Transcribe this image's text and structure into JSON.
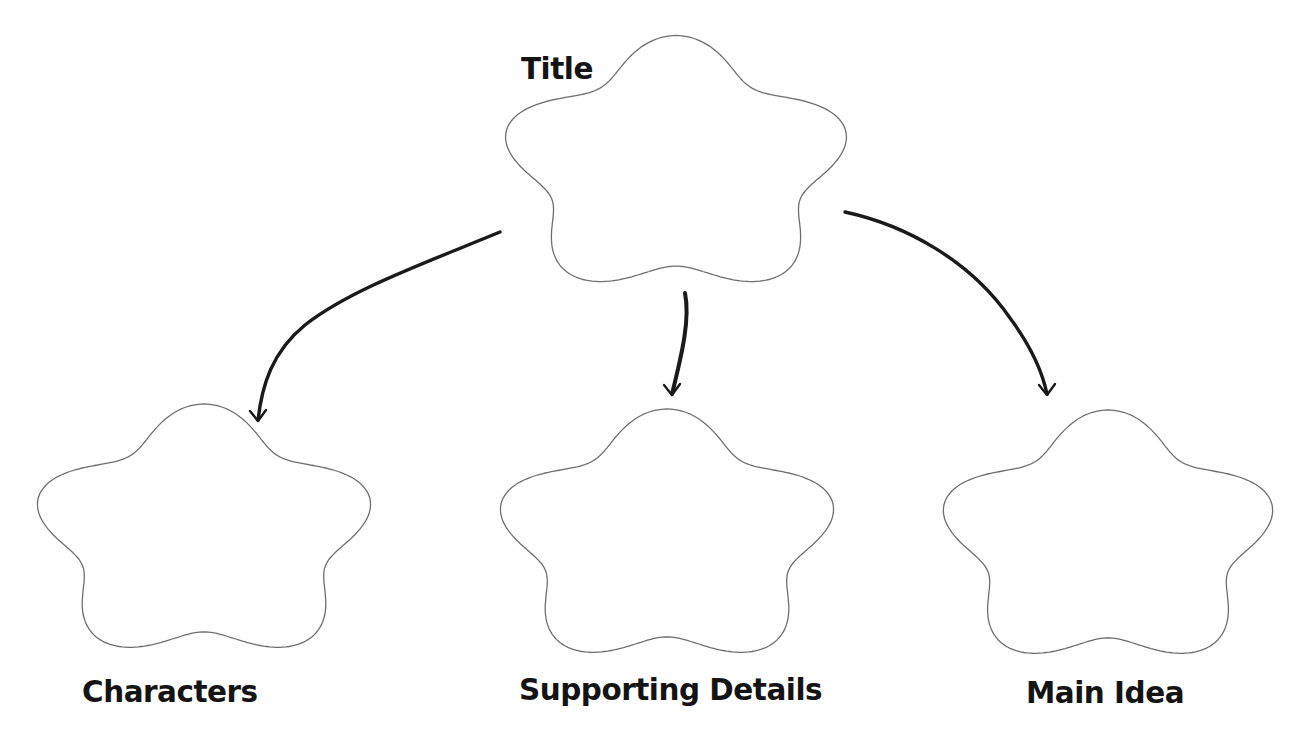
{
  "diagram": {
    "type": "graphic-organizer",
    "colors": {
      "background": "#ffffff",
      "outline": "#6e6e6e",
      "arrow": "#1a1a1a",
      "text": "#141414"
    },
    "nodes": [
      {
        "id": "title",
        "label": "Title",
        "cx": 676,
        "cy": 168,
        "w": 354,
        "h": 265,
        "label_x": 521,
        "label_y": 50,
        "font_size": 31
      },
      {
        "id": "characters",
        "label": "Characters",
        "cx": 204,
        "cy": 535,
        "w": 346,
        "h": 262,
        "label_x": 82,
        "label_y": 673,
        "font_size": 31
      },
      {
        "id": "supporting-details",
        "label": "Supporting Details",
        "cx": 667,
        "cy": 540,
        "w": 346,
        "h": 262,
        "label_x": 519,
        "label_y": 671,
        "font_size": 31
      },
      {
        "id": "main-idea",
        "label": "Main Idea",
        "cx": 1108,
        "cy": 541,
        "w": 342,
        "h": 262,
        "label_x": 1026,
        "label_y": 674,
        "font_size": 31
      }
    ],
    "edges": [
      {
        "from": "title",
        "to": "characters",
        "path": "M 500 232 C 420 265, 350 290, 305 325 C 272 352, 262 385, 258 420",
        "head": [
          258,
          421
        ],
        "width": 3.4
      },
      {
        "from": "title",
        "to": "supporting-details",
        "path": "M 685 293 C 690 318, 683 350, 672 394",
        "head": [
          672,
          395
        ],
        "width": 4
      },
      {
        "from": "title",
        "to": "main-idea",
        "path": "M 845 212 C 905 225, 970 260, 1010 318 C 1030 345, 1042 370, 1047 394",
        "head": [
          1047,
          395
        ],
        "width": 3.4
      }
    ]
  }
}
